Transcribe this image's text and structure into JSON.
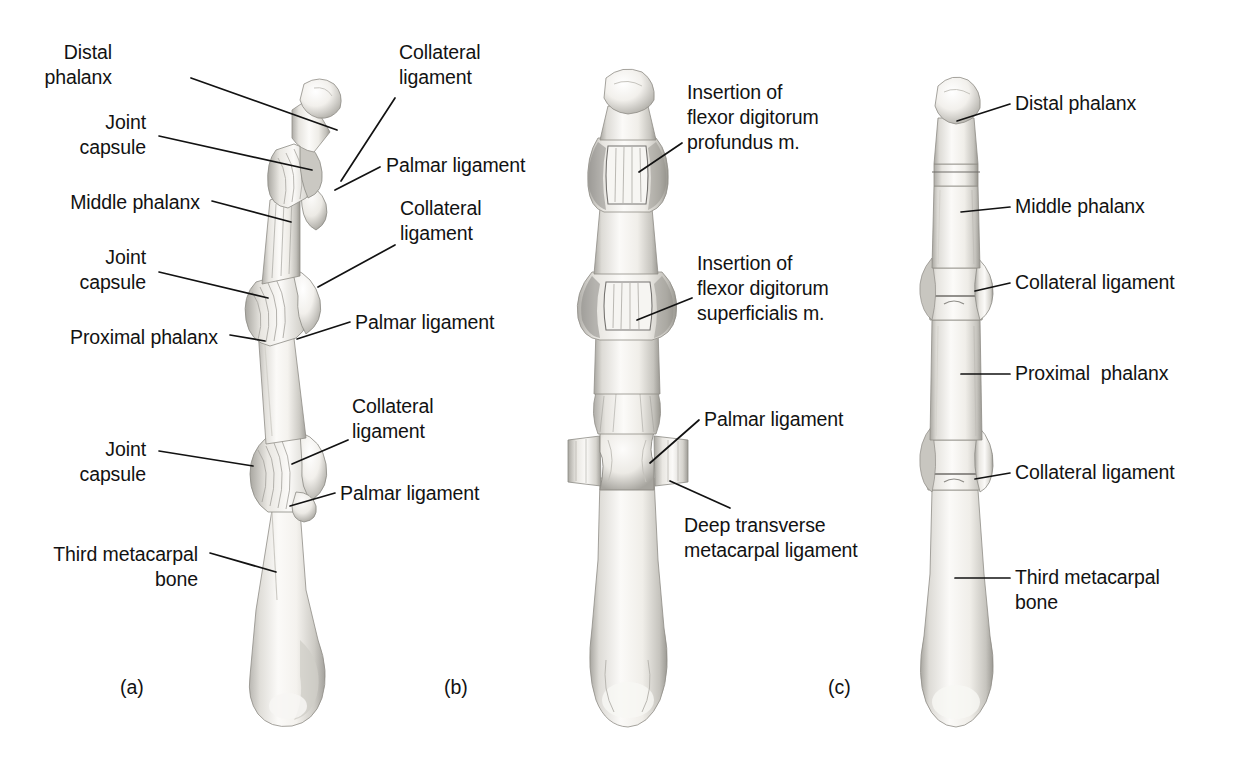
{
  "figure": {
    "width": 1234,
    "height": 769,
    "background_color": "#ffffff",
    "ink_color": "#121212",
    "bone_fill": "#f3f2f0",
    "bone_shadow": "#9a9893"
  },
  "panels": [
    {
      "id": "a",
      "caption": "(a)",
      "view": "lateral",
      "caption_x": 120,
      "caption_y": 676
    },
    {
      "id": "b",
      "caption": "(b)",
      "view": "palmar",
      "caption_x": 444,
      "caption_y": 676
    },
    {
      "id": "c",
      "caption": "(c)",
      "view": "dorsal",
      "caption_x": 828,
      "caption_y": 676
    }
  ],
  "labels": {
    "panel_a": [
      {
        "name": "distal-phalanx",
        "lines": [
          "Distal",
          "phalanx"
        ],
        "align": "right",
        "x": 112,
        "y": 40,
        "leader": {
          "x1": 191,
          "y1": 78,
          "x2": 337,
          "y2": 130
        }
      },
      {
        "name": "joint-capsule-dip",
        "lines": [
          "Joint",
          "capsule"
        ],
        "align": "right",
        "x": 146,
        "y": 110,
        "leader": {
          "x1": 159,
          "y1": 136,
          "x2": 312,
          "y2": 170
        }
      },
      {
        "name": "middle-phalanx",
        "lines": [
          "Middle phalanx"
        ],
        "align": "right",
        "x": 200,
        "y": 190,
        "leader": {
          "x1": 212,
          "y1": 201,
          "x2": 291,
          "y2": 222
        }
      },
      {
        "name": "joint-capsule-pip",
        "lines": [
          "Joint",
          "capsule"
        ],
        "align": "right",
        "x": 146,
        "y": 245,
        "leader": {
          "x1": 159,
          "y1": 272,
          "x2": 268,
          "y2": 298
        }
      },
      {
        "name": "proximal-phalanx",
        "lines": [
          "Proximal phalanx"
        ],
        "align": "right",
        "x": 218,
        "y": 325,
        "leader": {
          "x1": 230,
          "y1": 335,
          "x2": 265,
          "y2": 341
        }
      },
      {
        "name": "joint-capsule-mcp",
        "lines": [
          "Joint",
          "capsule"
        ],
        "align": "right",
        "x": 146,
        "y": 437,
        "leader": {
          "x1": 159,
          "y1": 451,
          "x2": 253,
          "y2": 466
        }
      },
      {
        "name": "third-metacarpal-bone",
        "lines": [
          "Third metacarpal",
          "bone"
        ],
        "align": "right",
        "x": 198,
        "y": 542,
        "leader": {
          "x1": 210,
          "y1": 553,
          "x2": 276,
          "y2": 572
        }
      },
      {
        "name": "collateral-ligament-dip",
        "lines": [
          "Collateral",
          "ligament"
        ],
        "align": "left",
        "x": 399,
        "y": 40,
        "leader": {
          "x1": 395,
          "y1": 98,
          "x2": 341,
          "y2": 181
        }
      },
      {
        "name": "palmar-ligament-pip",
        "lines": [
          "Palmar ligament"
        ],
        "align": "left",
        "x": 386,
        "y": 153,
        "leader": {
          "x1": 380,
          "y1": 167,
          "x2": 335,
          "y2": 190
        }
      },
      {
        "name": "collateral-ligament-pip",
        "lines": [
          "Collateral",
          "ligament"
        ],
        "align": "left",
        "x": 400,
        "y": 196,
        "leader": {
          "x1": 395,
          "y1": 245,
          "x2": 318,
          "y2": 287
        }
      },
      {
        "name": "palmar-ligament-mcp-upper",
        "lines": [
          "Palmar ligament"
        ],
        "align": "left",
        "x": 355,
        "y": 310,
        "leader": {
          "x1": 350,
          "y1": 322,
          "x2": 297,
          "y2": 339
        }
      },
      {
        "name": "collateral-ligament-mcp",
        "lines": [
          "Collateral",
          "ligament"
        ],
        "align": "left",
        "x": 352,
        "y": 394,
        "leader": {
          "x1": 348,
          "y1": 440,
          "x2": 292,
          "y2": 464
        }
      },
      {
        "name": "palmar-ligament-mcp",
        "lines": [
          "Palmar ligament"
        ],
        "align": "left",
        "x": 340,
        "y": 481,
        "leader": {
          "x1": 335,
          "y1": 493,
          "x2": 290,
          "y2": 506
        }
      }
    ],
    "panel_b": [
      {
        "name": "insertion-flexor-digitorum-profundus",
        "lines": [
          "Insertion of",
          "flexor digitorum",
          "profundus m."
        ],
        "align": "left",
        "x": 687,
        "y": 80,
        "leader": {
          "x1": 682,
          "y1": 143,
          "x2": 639,
          "y2": 172
        }
      },
      {
        "name": "insertion-flexor-digitorum-superficialis",
        "lines": [
          "Insertion of",
          "flexor digitorum",
          "superficialis m."
        ],
        "align": "left",
        "x": 697,
        "y": 251,
        "leader": {
          "x1": 692,
          "y1": 298,
          "x2": 637,
          "y2": 320
        }
      },
      {
        "name": "palmar-ligament-b",
        "lines": [
          "Palmar ligament"
        ],
        "align": "left",
        "x": 704,
        "y": 407,
        "leader": {
          "x1": 699,
          "y1": 420,
          "x2": 650,
          "y2": 463
        }
      },
      {
        "name": "deep-transverse-metacarpal-ligament",
        "lines": [
          "Deep transverse",
          "metacarpal ligament"
        ],
        "align": "left",
        "x": 684,
        "y": 513,
        "leader": {
          "x1": 730,
          "y1": 508,
          "x2": 670,
          "y2": 481
        }
      }
    ],
    "panel_c": [
      {
        "name": "distal-phalanx-c",
        "lines": [
          "Distal phalanx"
        ],
        "align": "left",
        "x": 1015,
        "y": 91,
        "leader": {
          "x1": 1010,
          "y1": 104,
          "x2": 957,
          "y2": 121
        }
      },
      {
        "name": "middle-phalanx-c",
        "lines": [
          "Middle phalanx"
        ],
        "align": "left",
        "x": 1015,
        "y": 194,
        "leader": {
          "x1": 1010,
          "y1": 207,
          "x2": 961,
          "y2": 212
        }
      },
      {
        "name": "collateral-ligament-c-pip",
        "lines": [
          "Collateral ligament"
        ],
        "align": "left",
        "x": 1015,
        "y": 270,
        "leader": {
          "x1": 1010,
          "y1": 283,
          "x2": 975,
          "y2": 291
        }
      },
      {
        "name": "proximal-phalanx-c",
        "lines": [
          "Proximal  phalanx"
        ],
        "align": "left",
        "x": 1015,
        "y": 361,
        "leader": {
          "x1": 1010,
          "y1": 374,
          "x2": 961,
          "y2": 374
        }
      },
      {
        "name": "collateral-ligament-c-mcp",
        "lines": [
          "Collateral ligament"
        ],
        "align": "left",
        "x": 1015,
        "y": 460,
        "leader": {
          "x1": 1010,
          "y1": 473,
          "x2": 975,
          "y2": 479
        }
      },
      {
        "name": "third-metacarpal-bone-c",
        "lines": [
          "Third metacarpal",
          "bone"
        ],
        "align": "left",
        "x": 1015,
        "y": 565,
        "leader": {
          "x1": 1010,
          "y1": 578,
          "x2": 955,
          "y2": 578
        }
      }
    ]
  }
}
